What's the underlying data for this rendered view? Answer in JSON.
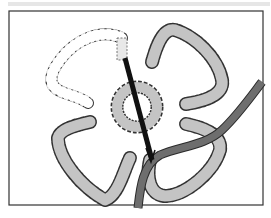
{
  "figure": {
    "colors": {
      "background": "#ffffff",
      "frame": "#333333",
      "top_band": "#e6e6e6",
      "lobe_fill": "#c4c4c4",
      "lobe_outline": "#333333",
      "open_lobe_fill": "#ffffff",
      "rod": "#111111",
      "tube_fill": "#6e6e6e",
      "tube_outline": "#2a2a2a"
    },
    "elements": [
      {
        "name": "upper-left-lobe",
        "style": "dashed-outline-unfilled"
      },
      {
        "name": "upper-right-lobe",
        "style": "dashed-outline-gray-filled"
      },
      {
        "name": "lower-left-lobe",
        "style": "dashed-outline-gray-filled"
      },
      {
        "name": "lower-right-lobe",
        "style": "dashed-outline-gray-filled"
      },
      {
        "name": "central-ring",
        "style": "dashed-outline-gray-filled"
      },
      {
        "name": "black-rod",
        "style": "solid-black"
      },
      {
        "name": "gray-tube",
        "style": "solid-gray"
      }
    ]
  }
}
